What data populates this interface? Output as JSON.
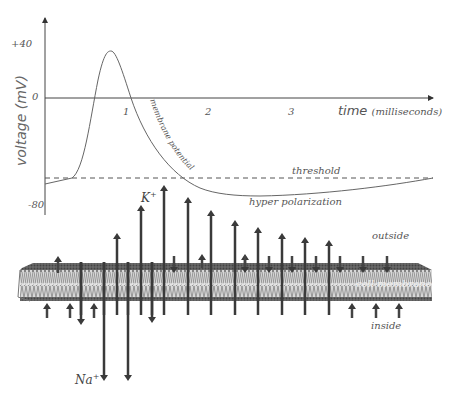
{
  "figure": {
    "y_axis": {
      "label": "voltage",
      "unit": "(mV)",
      "ticks": [
        "+40",
        "0",
        "-80"
      ]
    },
    "x_axis": {
      "label": "time",
      "unit": "(milliseconds)",
      "ticks": [
        "1",
        "2",
        "3"
      ]
    },
    "annotations": {
      "curve_label": "membrane potential",
      "threshold": "threshold",
      "hyper": "hyper polarization",
      "outside": "outside",
      "inside": "inside",
      "membrane": "cell membrane"
    },
    "ions": {
      "k_symbol": "K",
      "k_charge": "+",
      "na_symbol": "Na",
      "na_charge": "+"
    },
    "colors": {
      "line": "#555555",
      "arrow": "#3a3a3a",
      "membrane_top": "#5a5a5a",
      "membrane_body": "#9a9a9a"
    }
  }
}
